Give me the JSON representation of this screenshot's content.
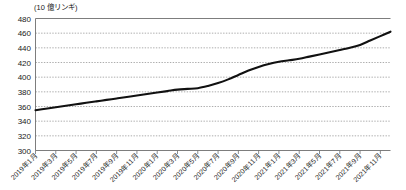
{
  "chart_data": {
    "type": "line",
    "title": "",
    "subtitle": "",
    "unit_label": "(10 億リンギ)",
    "xlabel": "",
    "ylabel": "",
    "ylim": [
      300,
      480
    ],
    "ytick_step": 20,
    "yticks": [
      480,
      460,
      440,
      420,
      400,
      380,
      360,
      340,
      320,
      300
    ],
    "ytick_labels": [
      "480",
      "460",
      "440",
      "420",
      "400",
      "380",
      "360",
      "340",
      "320",
      "300"
    ],
    "grid": true,
    "grid_style": "dotted-horizontal",
    "legend": false,
    "legend_position": "none",
    "xtick_labels": [
      "2019年1月",
      "2019年3月",
      "2019年5月",
      "2019年7月",
      "2019年9月",
      "2019年11月",
      "2020年1月",
      "2020年3月",
      "2020年5月",
      "2020年7月",
      "2020年9月",
      "2020年11月",
      "2021年1月",
      "2021年3月",
      "2021年5月",
      "2021年7月",
      "2021年9月",
      "2021年11月"
    ],
    "x": [
      "2019年1月",
      "2019年2月",
      "2019年3月",
      "2019年4月",
      "2019年5月",
      "2019年6月",
      "2019年7月",
      "2019年8月",
      "2019年9月",
      "2019年10月",
      "2019年11月",
      "2019年12月",
      "2020年1月",
      "2020年2月",
      "2020年3月",
      "2020年4月",
      "2020年5月",
      "2020年6月",
      "2020年7月",
      "2020年8月",
      "2020年9月",
      "2020年10月",
      "2020年11月",
      "2020年12月",
      "2021年1月",
      "2021年2月",
      "2021年3月",
      "2021年4月",
      "2021年5月",
      "2021年6月",
      "2021年7月",
      "2021年8月",
      "2021年9月",
      "2021年10月",
      "2021年11月",
      "2021年12月"
    ],
    "series": [
      {
        "name": "",
        "color": "#111111",
        "values": [
          355,
          357,
          359,
          361,
          363,
          365,
          367,
          369,
          371,
          373,
          375,
          377,
          379,
          381,
          383,
          384,
          385,
          388,
          392,
          397,
          403,
          409,
          414,
          418,
          421,
          423,
          425,
          428,
          431,
          434,
          437,
          440,
          444,
          450,
          456,
          462
        ]
      }
    ]
  }
}
